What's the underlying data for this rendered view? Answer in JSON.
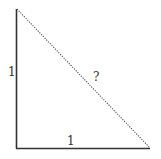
{
  "diagram": {
    "type": "right-triangle",
    "labels": {
      "vertical_leg": "1",
      "horizontal_leg": "1",
      "hypotenuse": "?"
    },
    "colors": {
      "solid_edge": "#333333",
      "dotted_edge": "#555555",
      "text": "#333333",
      "background": "#ffffff"
    }
  }
}
